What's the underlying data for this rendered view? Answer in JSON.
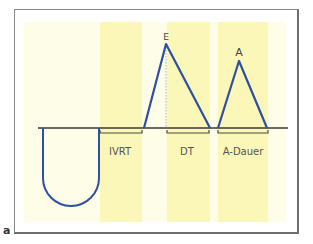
{
  "figure": {
    "panel_label": "a",
    "colors": {
      "frame": "#8a8a8a",
      "background_band": "#fefde8",
      "highlight_band": "#fbf7b8",
      "waveform": "#2f4fa0",
      "baseline": "#3a3a3a",
      "bracket": "#4a4a3a",
      "text": "#444444"
    },
    "peaks": {
      "e_wave": "E",
      "a_wave": "A"
    },
    "intervals": {
      "ivrt": "IVRT",
      "dt": "DT",
      "a_duration": "A-Dauer"
    }
  }
}
